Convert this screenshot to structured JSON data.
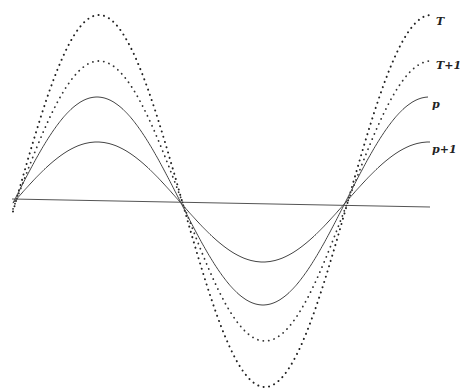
{
  "chart_data": {
    "type": "line",
    "title": "",
    "xlabel": "",
    "ylabel": "",
    "grid": false,
    "legend": "inline labels at right end of curves",
    "baseline": {
      "x1": 12,
      "y1": 199,
      "x2": 430,
      "y2": 207,
      "color": "#555555"
    },
    "series": [
      {
        "name": "T",
        "style": "dotted",
        "label": "T",
        "x_start": 13,
        "x_end": 432,
        "center_y": 201,
        "amplitude": 186,
        "peak_x": 99,
        "label_pos": [
          436,
          25
        ]
      },
      {
        "name": "T+1",
        "style": "dotted",
        "label": "T+1",
        "x_start": 13,
        "x_end": 432,
        "center_y": 201,
        "amplitude": 140,
        "peak_x": 99,
        "label_pos": [
          436,
          69
        ]
      },
      {
        "name": "p",
        "style": "solid",
        "label": "p",
        "x_start": 13,
        "x_end": 428,
        "center_y": 201,
        "amplitude": 104,
        "peak_x": 97,
        "label_pos": [
          432,
          108
        ]
      },
      {
        "name": "p+1",
        "style": "solid",
        "label": "p+1",
        "x_start": 13,
        "x_end": 430,
        "center_y": 202,
        "amplitude": 60,
        "peak_x": 97,
        "label_pos": [
          434,
          153
        ]
      }
    ],
    "period_px": 332
  },
  "labels": {
    "T": "T",
    "T1": "T+1",
    "p": "p",
    "p1": "p+1"
  }
}
